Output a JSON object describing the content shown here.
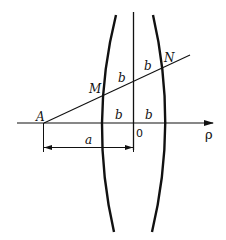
{
  "diagram": {
    "colors": {
      "stroke": "#111111",
      "background": "#ffffff"
    },
    "points": {
      "A": {
        "label": "A"
      },
      "M": {
        "label": "M"
      },
      "N": {
        "label": "N"
      },
      "origin": {
        "label": "0"
      }
    },
    "axis": {
      "label": "ρ"
    },
    "segments": {
      "b_upper_left": "b",
      "b_upper_right": "b",
      "b_lower_left": "b",
      "b_lower_right": "b"
    },
    "dimension": {
      "label": "a"
    }
  }
}
